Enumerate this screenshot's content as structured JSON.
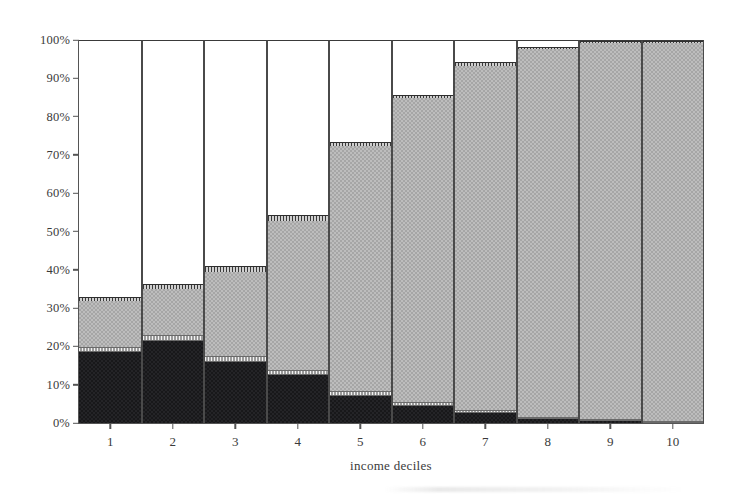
{
  "chart_data": {
    "type": "bar",
    "subtype": "stacked-100-percent",
    "title": "",
    "xlabel": "income deciles",
    "ylabel": "",
    "categories": [
      "1",
      "2",
      "3",
      "4",
      "5",
      "6",
      "7",
      "8",
      "9",
      "10"
    ],
    "ylim": [
      0,
      100
    ],
    "y_tick_labels": [
      "0%",
      "10%",
      "20%",
      "30%",
      "40%",
      "50%",
      "60%",
      "70%",
      "80%",
      "90%",
      "100%"
    ],
    "y_tick_values": [
      0,
      10,
      20,
      30,
      40,
      50,
      60,
      70,
      80,
      90,
      100
    ],
    "grid": false,
    "legend": "none",
    "series": [
      {
        "name": "black-segment",
        "fill": "solid-black",
        "color": "#18181a",
        "values": [
          18.5,
          21.5,
          16.0,
          12.5,
          7.0,
          4.5,
          2.5,
          1.0,
          0.5,
          0.0
        ]
      },
      {
        "name": "light-stripe-segment",
        "fill": "light-stripe",
        "color": "#cfcfcf",
        "values": [
          1.5,
          1.5,
          1.5,
          1.5,
          1.5,
          1.0,
          0.8,
          0.5,
          0.5,
          0.5
        ]
      },
      {
        "name": "gray-segment",
        "fill": "checker-gray",
        "color": "#a6a6a6",
        "values": [
          12.0,
          12.0,
          22.0,
          39.0,
          64.0,
          79.5,
          90.2,
          96.5,
          98.5,
          99.0
        ]
      },
      {
        "name": "dark-stripe-segment",
        "fill": "dark-stripe",
        "color": "#6b6b6b",
        "values": [
          1.0,
          1.5,
          1.5,
          1.5,
          1.0,
          1.0,
          1.0,
          0.5,
          0.5,
          0.5
        ]
      },
      {
        "name": "white-segment",
        "fill": "white",
        "color": "#ffffff",
        "values": [
          67.0,
          63.5,
          59.0,
          45.5,
          26.5,
          14.0,
          5.5,
          1.5,
          0.0,
          0.0
        ]
      }
    ],
    "bar_totals_non_white": [
      33.0,
      36.5,
      41.0,
      54.5,
      73.5,
      86.0,
      94.5,
      98.5,
      100.0,
      100.0
    ]
  }
}
